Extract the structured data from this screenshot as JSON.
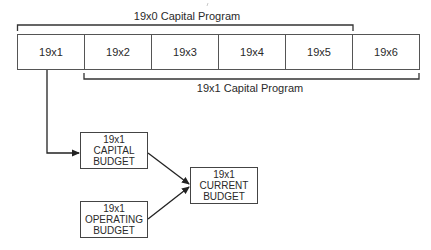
{
  "timeline": {
    "years": [
      "19x1",
      "19x2",
      "19x3",
      "19x4",
      "19x5",
      "19x6"
    ]
  },
  "brackets": {
    "top_label": "19x0 Capital Program",
    "bottom_label": "19x1 Capital Program"
  },
  "boxes": {
    "capital_budget": {
      "line1": "19x1",
      "line2": "CAPITAL",
      "line3": "BUDGET"
    },
    "operating_budget": {
      "line1": "19x1",
      "line2": "OPERATING",
      "line3": "BUDGET"
    },
    "current_budget": {
      "line1": "19x1",
      "line2": "CURRENT",
      "line3": "BUDGET"
    }
  },
  "colors": {
    "line": "#333333",
    "text": "#2a2a2a",
    "background": "#ffffff"
  }
}
